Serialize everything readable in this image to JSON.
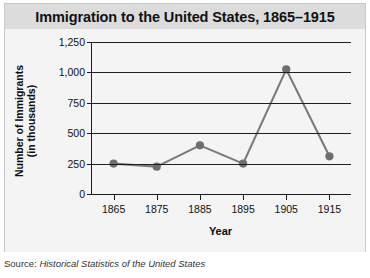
{
  "figure": {
    "title": "Immigration to the United States, 1865–1915",
    "source_label": "Source:",
    "source_title": "Historical Statistics of the United States"
  },
  "axis": {
    "ylabel_line1": "Number of Immigrants",
    "ylabel_line2": "(in thousands)",
    "xlabel": "Year"
  },
  "colors": {
    "line": "#7a7a7a",
    "marker": "#6e6e6e",
    "axis": "#1c1c1c",
    "title_band": "#dcdcdc",
    "plot_bg": "#f4f4f4"
  },
  "chart_data": {
    "type": "line",
    "title": "Immigration to the United States, 1865–1915",
    "xlabel": "Year",
    "ylabel": "Number of Immigrants (in thousands)",
    "x": [
      1865,
      1875,
      1885,
      1895,
      1905,
      1915
    ],
    "categories": [
      "1865",
      "1875",
      "1885",
      "1895",
      "1905",
      "1915"
    ],
    "values": [
      250,
      225,
      400,
      250,
      1025,
      310
    ],
    "series": [
      {
        "name": "Immigrants (in thousands)",
        "values": [
          250,
          225,
          400,
          250,
          1025,
          310
        ]
      }
    ],
    "xlim": [
      1860,
      1920
    ],
    "ylim": [
      0,
      1250
    ],
    "yticks": [
      0,
      250,
      500,
      750,
      1000,
      1250
    ],
    "ytick_labels": [
      "0",
      "250",
      "500",
      "750",
      "1,000",
      "1,250"
    ],
    "xticks": [
      1865,
      1875,
      1885,
      1895,
      1905,
      1915
    ],
    "xtick_labels": [
      "1865",
      "1875",
      "1885",
      "1895",
      "1905",
      "1915"
    ],
    "grid": "horizontal",
    "legend": "none",
    "markers": true
  }
}
